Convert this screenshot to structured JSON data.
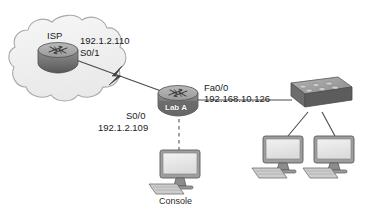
{
  "diagram": {
    "colors": {
      "background": "#ffffff",
      "cloud_fill": "#f0f0f0",
      "cloud_stroke": "#a8a8a8",
      "device_body": "#8c8c8c",
      "device_dark": "#5f5f5f",
      "device_light": "#d8d8d8",
      "screen_fill": "#e9e9e9",
      "link_stroke": "#4a4a4a",
      "text": "#1a1a1a"
    },
    "cloud": {
      "name": "isp-cloud"
    },
    "nodes": [
      {
        "id": "isp-router",
        "type": "router",
        "label": "ISP",
        "label_position": "above"
      },
      {
        "id": "lab-a-router",
        "type": "router",
        "label": "Lab A",
        "label_position": "on-body"
      },
      {
        "id": "switch",
        "type": "switch",
        "label": ""
      },
      {
        "id": "console-pc",
        "type": "workstation",
        "label": "Console",
        "label_position": "below"
      },
      {
        "id": "host-pc-1",
        "type": "workstation",
        "label": ""
      },
      {
        "id": "host-pc-2",
        "type": "workstation",
        "label": ""
      }
    ],
    "links": [
      {
        "id": "serial-wan-link",
        "from": "isp-router",
        "to": "lab-a-router",
        "style": "solid-with-lightning",
        "media": "serial"
      },
      {
        "id": "ethernet-link",
        "from": "lab-a-router",
        "to": "switch",
        "style": "solid",
        "media": "ethernet"
      },
      {
        "id": "switch-to-host-1",
        "from": "switch",
        "to": "host-pc-1",
        "style": "solid",
        "media": "ethernet"
      },
      {
        "id": "switch-to-host-2",
        "from": "switch",
        "to": "host-pc-2",
        "style": "solid",
        "media": "ethernet"
      },
      {
        "id": "console-link",
        "from": "lab-a-router",
        "to": "console-pc",
        "style": "dashed",
        "media": "console"
      }
    ],
    "annotations": {
      "isp_ip": "192.1.2.110",
      "isp_interface": "S0/1",
      "lab_a_serial_interface": "S0/0",
      "lab_a_serial_ip": "192.1.2.109",
      "lab_a_fast_ethernet_interface": "Fa0/0",
      "lab_a_fast_ethernet_ip": "192.168.10.126"
    }
  }
}
